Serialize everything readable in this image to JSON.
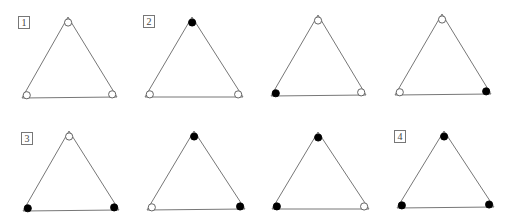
{
  "figure": {
    "stroke_color": "#777777",
    "fill_color": "#000000",
    "triangles": [
      {
        "label": "1",
        "label_pos": [
          18,
          16
        ],
        "vertices": [
          [
            68,
            17
          ],
          [
            22,
            98
          ],
          [
            117,
            97
          ]
        ],
        "states": [
          "open",
          "open",
          "open"
        ]
      },
      {
        "label": "2",
        "label_pos": [
          143,
          15
        ],
        "vertices": [
          [
            192,
            17
          ],
          [
            145,
            97
          ],
          [
            243,
            97
          ]
        ],
        "states": [
          "filled",
          "open",
          "open"
        ]
      },
      {
        "label": "",
        "vertices": [
          [
            318,
            15
          ],
          [
            271,
            96
          ],
          [
            366,
            95
          ]
        ],
        "states": [
          "open",
          "filled",
          "open"
        ]
      },
      {
        "label": "",
        "vertices": [
          [
            442,
            14
          ],
          [
            395,
            95
          ],
          [
            491,
            94
          ]
        ],
        "states": [
          "open",
          "open",
          "filled"
        ]
      },
      {
        "label": "3",
        "label_pos": [
          21,
          132
        ],
        "vertices": [
          [
            69,
            131
          ],
          [
            23,
            211
          ],
          [
            119,
            210
          ]
        ],
        "states": [
          "open",
          "filled",
          "filled"
        ]
      },
      {
        "label": "",
        "vertices": [
          [
            194,
            131
          ],
          [
            147,
            210
          ],
          [
            245,
            209
          ]
        ],
        "states": [
          "filled",
          "open",
          "filled"
        ]
      },
      {
        "label": "",
        "vertices": [
          [
            318,
            132
          ],
          [
            272,
            209
          ],
          [
            369,
            209
          ]
        ],
        "states": [
          "filled",
          "filled",
          "open"
        ]
      },
      {
        "label": "4",
        "label_pos": [
          394,
          130
        ],
        "vertices": [
          [
            444,
            131
          ],
          [
            397,
            208
          ],
          [
            494,
            207
          ]
        ],
        "states": [
          "filled",
          "filled",
          "filled"
        ]
      }
    ]
  }
}
